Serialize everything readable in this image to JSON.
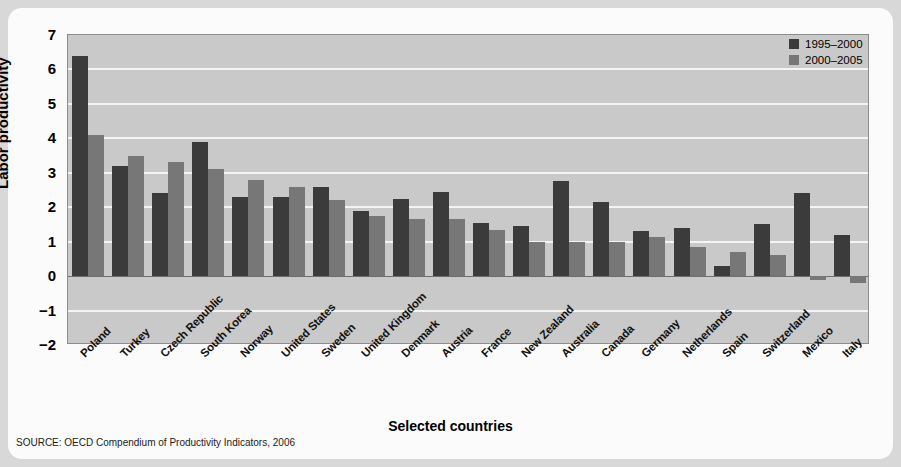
{
  "chart_data": {
    "type": "bar",
    "title": "",
    "xlabel": "Selected countries",
    "ylabel": "Labor productivity",
    "ylim": [
      -2,
      7
    ],
    "yticks": [
      7,
      6,
      5,
      4,
      3,
      2,
      1,
      0,
      -1,
      -2
    ],
    "grid": true,
    "legend_position": "top-right",
    "categories": [
      "Poland",
      "Turkey",
      "Czech Republic",
      "South Korea",
      "Norway",
      "United States",
      "Sweden",
      "United Kingdom",
      "Denmark",
      "Austria",
      "France",
      "New Zealand",
      "Australia",
      "Canada",
      "Germany",
      "Netherlands",
      "Spain",
      "Switzerland",
      "Mexico",
      "Italy"
    ],
    "series": [
      {
        "name": "1995–2000",
        "color": "#3b3b3b",
        "values": [
          6.4,
          3.2,
          2.4,
          3.9,
          2.3,
          2.3,
          2.6,
          1.9,
          2.25,
          2.45,
          1.55,
          1.45,
          2.75,
          2.15,
          1.3,
          1.4,
          0.3,
          1.5,
          2.4,
          1.2
        ]
      },
      {
        "name": "2000–2005",
        "color": "#777777",
        "values": [
          4.1,
          3.5,
          3.3,
          3.1,
          2.8,
          2.6,
          2.2,
          1.75,
          1.65,
          1.65,
          1.35,
          1.0,
          1.0,
          1.0,
          1.15,
          0.85,
          0.7,
          0.6,
          -0.1,
          -0.2
        ]
      }
    ],
    "source": "SOURCE: OECD Compendium of Productivity Indicators, 2006"
  },
  "colors": {
    "series_1995_2000": "#3b3b3b",
    "series_2000_2005": "#777777",
    "plot_background": "#c9c9c9",
    "card_background": "#fbfbfb",
    "page_background": "#d8d8d8",
    "gridline": "#f4f4f4"
  }
}
